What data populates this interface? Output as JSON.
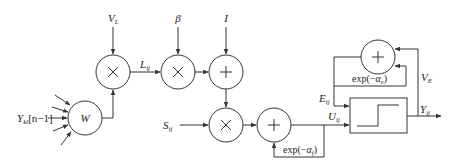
{
  "diagram": {
    "type": "block-diagram",
    "inputs": {
      "feedback_input": {
        "base": "Y",
        "sub": "kl",
        "suffix": "[n−1]"
      },
      "v_l": {
        "base": "V",
        "sub": "L"
      },
      "beta": {
        "base": "β"
      },
      "i": {
        "base": "I"
      },
      "s_ij": {
        "base": "S",
        "sub": "ij"
      }
    },
    "nodes": [
      {
        "id": "w",
        "symbol": "W"
      },
      {
        "id": "mult1",
        "symbol": "×"
      },
      {
        "id": "mult2",
        "symbol": "×"
      },
      {
        "id": "add1",
        "symbol": "+"
      },
      {
        "id": "mult3",
        "symbol": "×"
      },
      {
        "id": "add2",
        "symbol": "+"
      },
      {
        "id": "add3",
        "symbol": "+"
      },
      {
        "id": "step",
        "symbol": "step-function"
      }
    ],
    "signals": {
      "l_ij": {
        "base": "L",
        "sub": "ij"
      },
      "u_ij": {
        "base": "U",
        "sub": "ij"
      },
      "e_ij": {
        "base": "E",
        "sub": "ij"
      },
      "v_e": {
        "base": "V",
        "sub": "E"
      },
      "y_ij": {
        "base": "Y",
        "sub": "ij"
      }
    },
    "decay_labels": {
      "feedback_f": {
        "prefix": "exp(−",
        "base": "α",
        "sub": "f",
        "suffix": ")"
      },
      "feedback_e": {
        "prefix": "exp(−",
        "base": "α",
        "sub": "e",
        "suffix": ")"
      }
    },
    "edges": [
      [
        "Y_kl[n-1]",
        "w"
      ],
      [
        "w",
        "mult1"
      ],
      [
        "V_L",
        "mult1"
      ],
      [
        "mult1",
        "mult2"
      ],
      [
        "beta",
        "mult2"
      ],
      [
        "mult2",
        "add1"
      ],
      [
        "I",
        "add1"
      ],
      [
        "add1",
        "mult3"
      ],
      [
        "S_ij",
        "mult3"
      ],
      [
        "mult3",
        "add2"
      ],
      [
        "add2",
        "add2 (exp(-α_f))"
      ],
      [
        "add2",
        "step (U_ij)"
      ],
      [
        "add3",
        "step (E_ij)"
      ],
      [
        "add3",
        "add3 (exp(-α_e))"
      ],
      [
        "step",
        "Y_ij"
      ],
      [
        "Y_ij",
        "add3 (V_E)"
      ]
    ]
  }
}
